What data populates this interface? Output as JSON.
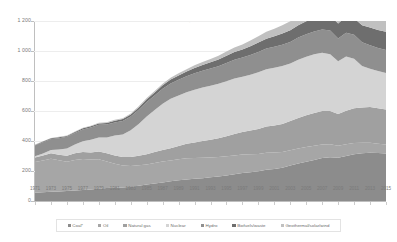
{
  "chart_data": {
    "type": "area",
    "stacked": true,
    "title": "",
    "xlabel": "",
    "ylabel": "",
    "ylim": [
      0,
      1200
    ],
    "yticks": [
      0,
      200,
      400,
      600,
      800,
      1000,
      1200
    ],
    "ytick_labels": [
      "0",
      "200",
      "400",
      "600",
      "800",
      "1 000",
      "1 200"
    ],
    "grid": true,
    "legend_position": "bottom",
    "x": [
      1971,
      1972,
      1973,
      1974,
      1975,
      1976,
      1977,
      1978,
      1979,
      1980,
      1981,
      1982,
      1983,
      1984,
      1985,
      1986,
      1987,
      1988,
      1989,
      1990,
      1991,
      1992,
      1993,
      1994,
      1995,
      1996,
      1997,
      1998,
      1999,
      2000,
      2001,
      2002,
      2003,
      2004,
      2005,
      2006,
      2007,
      2008,
      2009,
      2010,
      2011,
      2012,
      2013,
      2014,
      2015
    ],
    "xtick_labels": [
      "1971",
      "1973",
      "1975",
      "1977",
      "1979",
      "1981",
      "1983",
      "1985",
      "1987",
      "1989",
      "1991",
      "1993",
      "1995",
      "1997",
      "1999",
      "2001",
      "2003",
      "2005",
      "2007",
      "2009",
      "2011",
      "2013",
      "2015"
    ],
    "series": [
      {
        "name": "Coal*",
        "color": "#8c8c8c",
        "values": [
          55,
          58,
          62,
          63,
          66,
          70,
          74,
          76,
          82,
          86,
          88,
          90,
          95,
          102,
          110,
          116,
          124,
          132,
          138,
          143,
          148,
          152,
          158,
          163,
          170,
          178,
          186,
          192,
          198,
          208,
          214,
          222,
          236,
          250,
          262,
          274,
          286,
          292,
          288,
          300,
          312,
          318,
          322,
          320,
          316
        ]
      },
      {
        "name": "Oil",
        "color": "#a6a6a6",
        "values": [
          205,
          212,
          220,
          208,
          196,
          204,
          206,
          200,
          196,
          178,
          160,
          146,
          138,
          136,
          134,
          138,
          140,
          138,
          140,
          142,
          138,
          136,
          132,
          130,
          128,
          126,
          124,
          120,
          116,
          114,
          110,
          104,
          102,
          100,
          98,
          94,
          90,
          86,
          80,
          78,
          74,
          70,
          66,
          62,
          60
        ]
      },
      {
        "name": "Natural gas",
        "color": "#a0a0a0",
        "values": [
          30,
          33,
          36,
          38,
          40,
          44,
          46,
          48,
          52,
          54,
          56,
          58,
          60,
          64,
          68,
          72,
          76,
          82,
          88,
          96,
          104,
          112,
          118,
          126,
          134,
          142,
          150,
          158,
          166,
          174,
          180,
          188,
          196,
          204,
          212,
          218,
          224,
          222,
          212,
          224,
          232,
          236,
          238,
          236,
          234
        ]
      },
      {
        "name": "Nuclear",
        "color": "#d4d4d4",
        "values": [
          8,
          14,
          22,
          34,
          48,
          58,
          72,
          84,
          94,
          106,
          132,
          150,
          178,
          212,
          252,
          280,
          308,
          330,
          338,
          344,
          352,
          356,
          360,
          362,
          366,
          370,
          368,
          372,
          378,
          382,
          384,
          386,
          382,
          388,
          390,
          392,
          388,
          378,
          352,
          362,
          330,
          276,
          256,
          248,
          244
        ]
      },
      {
        "name": "Hydro",
        "color": "#8f8f8f",
        "values": [
          72,
          74,
          73,
          76,
          78,
          77,
          79,
          82,
          84,
          86,
          88,
          90,
          92,
          94,
          96,
          98,
          100,
          102,
          104,
          106,
          110,
          112,
          116,
          118,
          122,
          126,
          128,
          132,
          136,
          138,
          140,
          142,
          144,
          148,
          150,
          152,
          156,
          158,
          152,
          158,
          160,
          158,
          156,
          154,
          152
        ]
      },
      {
        "name": "Biofuels/waste",
        "color": "#6e6e6e",
        "values": [
          4,
          5,
          5,
          6,
          6,
          7,
          8,
          8,
          9,
          10,
          11,
          12,
          14,
          16,
          18,
          20,
          23,
          26,
          29,
          32,
          35,
          38,
          41,
          44,
          48,
          51,
          54,
          58,
          62,
          66,
          70,
          74,
          78,
          82,
          86,
          90,
          94,
          98,
          100,
          106,
          110,
          114,
          118,
          120,
          122
        ]
      },
      {
        "name": "Geothermal/solar/wind",
        "color": "#c0c0c0",
        "values": [
          2,
          2,
          2,
          3,
          3,
          3,
          4,
          4,
          5,
          5,
          6,
          6,
          7,
          8,
          9,
          10,
          11,
          12,
          14,
          16,
          18,
          20,
          22,
          25,
          28,
          31,
          34,
          38,
          42,
          46,
          50,
          55,
          60,
          66,
          72,
          80,
          88,
          96,
          102,
          112,
          124,
          136,
          148,
          158,
          168
        ]
      }
    ]
  },
  "legend": {
    "items": [
      {
        "label": "Coal*"
      },
      {
        "label": "Oil"
      },
      {
        "label": "Natural gas"
      },
      {
        "label": "Nuclear"
      },
      {
        "label": "Hydro"
      },
      {
        "label": "Biofuels/waste"
      },
      {
        "label": "Geothermal/solar/wind"
      }
    ]
  }
}
